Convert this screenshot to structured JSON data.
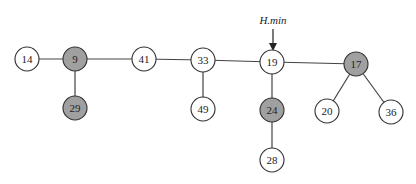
{
  "diagram": {
    "pointer": {
      "label": "H.min",
      "target": "19",
      "x": 273,
      "y_text": 24,
      "y_start": 29,
      "y_end": 51
    },
    "colors": {
      "marked": "#a0a0a0",
      "unmarked": "#ffffff",
      "stroke": "#333333",
      "edge": "#444444"
    },
    "nodes": [
      {
        "id": "14",
        "label": "14",
        "x": 27,
        "y": 59,
        "marked": false
      },
      {
        "id": "9",
        "label": "9",
        "x": 75,
        "y": 59,
        "marked": true
      },
      {
        "id": "29",
        "label": "29",
        "x": 75,
        "y": 108,
        "marked": true
      },
      {
        "id": "41",
        "label": "41",
        "x": 144,
        "y": 59,
        "marked": false
      },
      {
        "id": "33",
        "label": "33",
        "x": 203,
        "y": 60,
        "marked": false
      },
      {
        "id": "49",
        "label": "49",
        "x": 203,
        "y": 109,
        "marked": false
      },
      {
        "id": "19",
        "label": "19",
        "x": 272,
        "y": 62,
        "marked": false
      },
      {
        "id": "24",
        "label": "24",
        "x": 272,
        "y": 110,
        "marked": true
      },
      {
        "id": "28",
        "label": "28",
        "x": 272,
        "y": 160,
        "marked": false
      },
      {
        "id": "17",
        "label": "17",
        "x": 356,
        "y": 64,
        "marked": true
      },
      {
        "id": "20",
        "label": "20",
        "x": 327,
        "y": 111,
        "marked": false
      },
      {
        "id": "36",
        "label": "36",
        "x": 391,
        "y": 112,
        "marked": false
      }
    ],
    "edges": [
      [
        "14",
        "9"
      ],
      [
        "9",
        "41"
      ],
      [
        "41",
        "33"
      ],
      [
        "33",
        "19"
      ],
      [
        "19",
        "17"
      ],
      [
        "9",
        "29"
      ],
      [
        "33",
        "49"
      ],
      [
        "19",
        "24"
      ],
      [
        "24",
        "28"
      ],
      [
        "17",
        "20"
      ],
      [
        "17",
        "36"
      ]
    ]
  }
}
